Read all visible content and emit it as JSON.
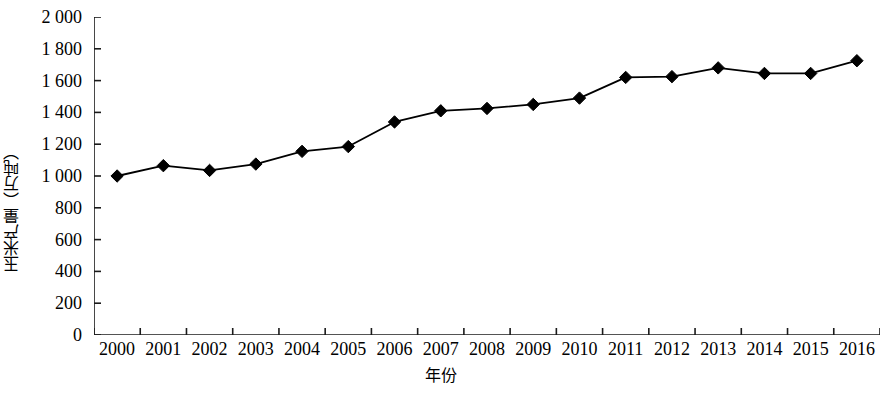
{
  "chart_data": {
    "type": "line",
    "title": "",
    "xlabel": "年份",
    "ylabel": "玉米产量（万吨）",
    "categories": [
      "2000",
      "2001",
      "2002",
      "2003",
      "2004",
      "2005",
      "2006",
      "2007",
      "2008",
      "2009",
      "2010",
      "2011",
      "2012",
      "2013",
      "2014",
      "2015",
      "2016"
    ],
    "values": [
      1000,
      1065,
      1035,
      1075,
      1155,
      1185,
      1340,
      1410,
      1425,
      1450,
      1490,
      1620,
      1625,
      1680,
      1645,
      1645,
      1725
    ],
    "series": [
      {
        "name": "玉米产量",
        "values": [
          1000,
          1065,
          1035,
          1075,
          1155,
          1185,
          1340,
          1410,
          1425,
          1450,
          1490,
          1620,
          1625,
          1680,
          1645,
          1645,
          1725
        ]
      }
    ],
    "ylim": [
      0,
      2000
    ],
    "y_ticks": [
      0,
      200,
      400,
      600,
      800,
      1000,
      1200,
      1400,
      1600,
      1800,
      2000
    ],
    "y_tick_labels": [
      "0",
      "200",
      "400",
      "600",
      "800",
      "1 000",
      "1 200",
      "1 400",
      "1 600",
      "1 800",
      "2 000"
    ],
    "grid": false,
    "legend": null,
    "marker": "diamond",
    "marker_color": "#000000",
    "line_color": "#000000"
  },
  "axes": {
    "y_title": "玉米产量（万吨）",
    "x_title": "年份"
  }
}
